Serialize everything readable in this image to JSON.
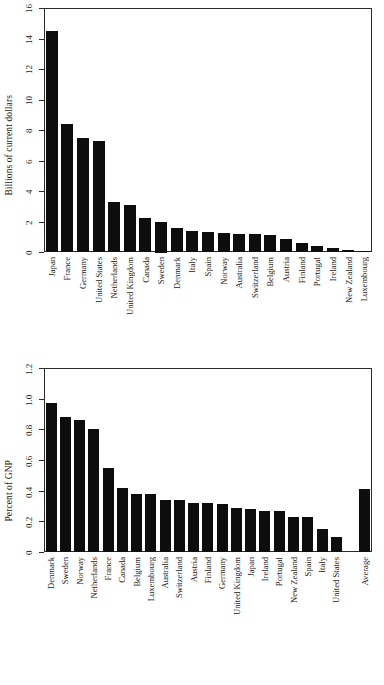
{
  "chart_data": [
    {
      "type": "bar",
      "title": "",
      "xlabel": "",
      "ylabel": "Billions of current dollars",
      "ylim": [
        0,
        16
      ],
      "yticks": [
        0,
        2,
        4,
        6,
        8,
        10,
        12,
        14,
        16
      ],
      "ytick_labels": [
        "0",
        "2",
        "4",
        "6",
        "8",
        "10",
        "12",
        "14",
        "16"
      ],
      "grid": false,
      "legend": "none",
      "categories": [
        "Japan",
        "France",
        "Germany",
        "United States",
        "Netherlands",
        "United Kingdom",
        "Canada",
        "Sweden",
        "Denmark",
        "Italy",
        "Spain",
        "Norway",
        "Australia",
        "Switzerland",
        "Belgium",
        "Austria",
        "Finland",
        "Portugal",
        "Ireland",
        "New Zealand",
        "Luxembourg"
      ],
      "values": [
        14.5,
        8.4,
        7.5,
        7.3,
        3.25,
        3.1,
        2.25,
        2.0,
        1.6,
        1.4,
        1.3,
        1.25,
        1.2,
        1.15,
        1.1,
        0.85,
        0.6,
        0.4,
        0.25,
        0.12,
        0.08
      ]
    },
    {
      "type": "bar",
      "title": "",
      "xlabel": "",
      "ylabel": "Percent of GNP",
      "ylim": [
        0,
        1.2
      ],
      "yticks": [
        0,
        0.2,
        0.4,
        0.6,
        0.8,
        1.0,
        1.2
      ],
      "ytick_labels": [
        "0",
        "0.2",
        "0.4",
        "0.6",
        "0.8",
        "1.0",
        "1.2"
      ],
      "grid": false,
      "legend": "none",
      "categories": [
        "Denmark",
        "Sweden",
        "Norway",
        "Netherlands",
        "France",
        "Canada",
        "Belgium",
        "Luxembourg",
        "Australia",
        "Switzerland",
        "Austria",
        "Finland",
        "Germany",
        "United Kingdom",
        "Japan",
        "Ireland",
        "Portugal",
        "New Zealand",
        "Spain",
        "Italy",
        "United States",
        "Average"
      ],
      "values": [
        0.97,
        0.88,
        0.86,
        0.8,
        0.55,
        0.42,
        0.38,
        0.38,
        0.34,
        0.34,
        0.32,
        0.32,
        0.31,
        0.29,
        0.28,
        0.27,
        0.27,
        0.23,
        0.23,
        0.15,
        0.1,
        0.41
      ],
      "gap_before_last": true
    }
  ],
  "colors": {
    "bar": "#0d0d0d",
    "axis": "#2b2b2b",
    "background": "#ffffff",
    "text": "#1a1a1a"
  }
}
